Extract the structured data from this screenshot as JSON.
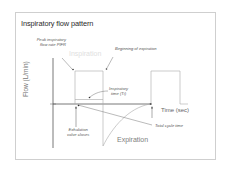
{
  "diagram": {
    "title": "Inspiratory flow pattern",
    "y_axis_label": "Flow (L/min)",
    "x_axis_label": "Time (sec)",
    "phase_labels": {
      "inspiration": "Inspiration",
      "expiration": "Expiration"
    },
    "annotations": {
      "pifr_line1": "Peak inspiratory",
      "pifr_line2": "flow rate PIFR",
      "beginning_expiration": "Beginning of expiration",
      "ti_line1": "Inspiratory",
      "ti_line2": "time (Ti)",
      "exhalation_line1": "Exhalation",
      "exhalation_line2": "valve closes",
      "total_cycle": "Total cycle time"
    },
    "colors": {
      "frame": "#cfcfcf",
      "axis": "#555555",
      "waveform": "#9a9a9a",
      "inspiration_label": "#e2e2e2",
      "expiration_label": "#777777"
    }
  }
}
